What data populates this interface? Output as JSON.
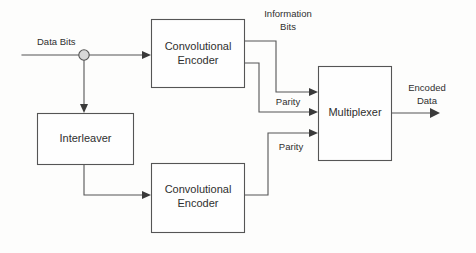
{
  "diagram": {
    "colors": {
      "background": "#fdfdfc",
      "line": "#555555",
      "text": "#2f2f2f",
      "arrow": "#3a3a3a",
      "node_fill": "#d8d8d8",
      "block_fill": "#fefefe"
    },
    "blocks": [
      {
        "id": "convolutional-encoder-top",
        "line1": "Convolutional",
        "line2": "Encoder"
      },
      {
        "id": "interleaver",
        "line1": "Interleaver",
        "line2": ""
      },
      {
        "id": "convolutional-encoder-bottom",
        "line1": "Convolutional",
        "line2": "Encoder"
      },
      {
        "id": "multiplexer",
        "line1": "Multiplexer",
        "line2": ""
      }
    ],
    "signal_labels": [
      {
        "id": "data-bits",
        "line1": "Data Bits",
        "line2": ""
      },
      {
        "id": "information-bits",
        "line1": "Information",
        "line2": "Bits"
      },
      {
        "id": "parity-top",
        "line1": "Parity",
        "line2": ""
      },
      {
        "id": "parity-bottom",
        "line1": "Parity",
        "line2": ""
      },
      {
        "id": "encoded-data",
        "line1": "Encoded",
        "line2": "Data"
      }
    ],
    "junction": {
      "id": "split-node",
      "name": "signal-split-node"
    }
  }
}
